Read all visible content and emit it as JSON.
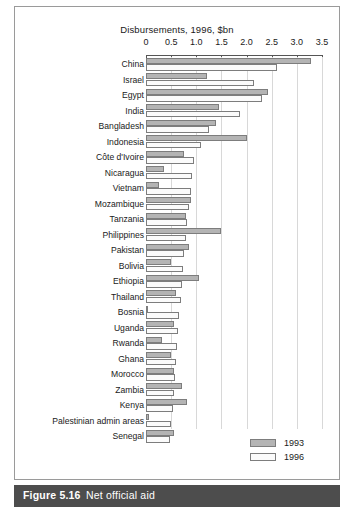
{
  "figure": {
    "caption_number": "Figure 5.16",
    "caption_text": "Net official aid"
  },
  "chart_data": {
    "type": "bar",
    "orientation": "horizontal",
    "title": "Disbursements, 1996, $bn",
    "xlabel": "",
    "ylabel": "",
    "xlim": [
      0,
      3.5
    ],
    "xticks": [
      0,
      0.5,
      1.0,
      1.5,
      2.0,
      2.5,
      3.0,
      3.5
    ],
    "xtick_labels": [
      "0",
      "0.5",
      "1.0",
      "1.5",
      "2.0",
      "2.5",
      "3.0",
      "3.5"
    ],
    "grid": true,
    "legend_position": "bottom-right",
    "categories": [
      "China",
      "Israel",
      "Egypt",
      "India",
      "Bangladesh",
      "Indonesia",
      "Côte d'Ivoire",
      "Nicaragua",
      "Vietnam",
      "Mozambique",
      "Tanzania",
      "Philippines",
      "Pakistan",
      "Bolivia",
      "Ethiopia",
      "Thailand",
      "Bosnia",
      "Uganda",
      "Rwanda",
      "Ghana",
      "Morocco",
      "Zambia",
      "Kenya",
      "Palestinian admin areas",
      "Senegal"
    ],
    "series": [
      {
        "name": "1993",
        "color": "#b4b4b4",
        "values": [
          3.28,
          1.22,
          2.42,
          1.45,
          1.4,
          2.0,
          0.75,
          0.36,
          0.26,
          0.9,
          0.8,
          1.5,
          0.86,
          0.5,
          1.05,
          0.6,
          0.03,
          0.55,
          0.32,
          0.5,
          0.56,
          0.72,
          0.82,
          0.05,
          0.56
        ]
      },
      {
        "name": "1996",
        "color": "#fbfbfb",
        "values": [
          2.6,
          2.15,
          2.3,
          1.86,
          1.26,
          1.1,
          0.96,
          0.92,
          0.9,
          0.86,
          0.82,
          0.8,
          0.76,
          0.73,
          0.71,
          0.69,
          0.66,
          0.63,
          0.61,
          0.6,
          0.58,
          0.56,
          0.53,
          0.5,
          0.48
        ]
      }
    ]
  },
  "legend": {
    "entries": [
      {
        "label": "1993",
        "swatch_class": "sw-1993"
      },
      {
        "label": "1996",
        "swatch_class": "sw-1996"
      }
    ]
  }
}
